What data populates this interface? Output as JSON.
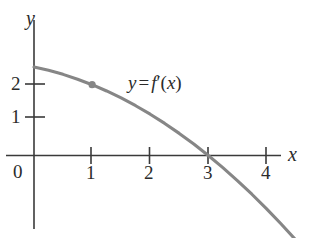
{
  "figure": {
    "background_color": "#ffffff",
    "axis_color": "#3a3a3a",
    "curve_color": "#868686",
    "text_color": "#2b2b2b",
    "y_axis_name": "y",
    "x_axis_name": "x",
    "origin_label": "0",
    "curve_label": {
      "lhs": "y",
      "operator": "=",
      "fn": "f",
      "prime": "′",
      "open_paren": "(",
      "arg": "x",
      "close_paren": ")",
      "full": "y = f′(x)"
    }
  },
  "chart_data": {
    "type": "line",
    "title": "",
    "subtitle": "",
    "xlabel": "x",
    "ylabel": "y",
    "xlim": [
      -0.45,
      4.9
    ],
    "ylim": [
      -2.2,
      3.05
    ],
    "grid": false,
    "legend": "none",
    "x_ticks": [
      1,
      2,
      3,
      4
    ],
    "x_tick_labels": [
      "1",
      "2",
      "3",
      "4"
    ],
    "y_ticks": [
      1,
      2
    ],
    "y_tick_labels": [
      "1",
      "2"
    ],
    "origin_tick_label": "0",
    "series": [
      {
        "name": "y = f'(x)",
        "annotation": "y = f′(x)",
        "color": "#868686",
        "equation": "y = -(1/6)x^2 - (1/3)x + 2.5",
        "x": [
          0,
          0.25,
          0.5,
          0.75,
          1,
          1.25,
          1.5,
          1.75,
          2,
          2.25,
          2.5,
          2.75,
          3,
          3.25,
          3.5,
          3.75,
          4,
          4.25,
          4.5,
          4.75
        ],
        "y": [
          2.5,
          2.406,
          2.292,
          2.156,
          2.0,
          1.823,
          1.625,
          1.406,
          1.167,
          0.906,
          0.625,
          0.323,
          0.0,
          -0.344,
          -0.708,
          -1.094,
          -1.5,
          -1.927,
          -2.375,
          -2.844
        ]
      }
    ],
    "points": [
      {
        "name": "marked-point",
        "x": 1,
        "y": 2,
        "color": "#868686",
        "label": ""
      }
    ],
    "x_intercepts": [
      3
    ],
    "y_intercept": 2.5,
    "annotations": [
      {
        "text": "y = f′(x)",
        "x": 1.85,
        "y": 2.05
      }
    ]
  }
}
